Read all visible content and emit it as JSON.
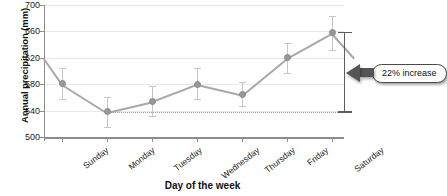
{
  "chart_data": {
    "type": "line",
    "title": "",
    "xlabel": "Day of the week",
    "ylabel": "Annual precipitation (mm)",
    "categories": [
      "Sunday",
      "Monday",
      "Tuesday",
      "Wednesday",
      "Thursday",
      "Friday",
      "Saturday"
    ],
    "values": [
      581,
      538,
      554,
      580,
      564,
      620,
      658
    ],
    "error_low": [
      558,
      515,
      532,
      557,
      547,
      597,
      632
    ],
    "error_high": [
      604,
      561,
      577,
      604,
      583,
      643,
      684
    ],
    "ylim": [
      500,
      700
    ],
    "yticks": [
      500,
      540,
      580,
      620,
      660,
      700
    ],
    "ytick_labels": [
      "500",
      "540",
      "580",
      "620",
      "660",
      "700"
    ],
    "grid": true,
    "legend": "none",
    "reference_line": {
      "value": 538,
      "style": "dotted",
      "from": "Monday",
      "to": "Saturday"
    },
    "annotations": [
      {
        "text": "22% increase",
        "from_value": 538,
        "to_value": 658,
        "at": "Saturday"
      }
    ],
    "series_color": "#989898",
    "error_color": "#c6c6c6",
    "annotation_color": "#555555",
    "grid_color": "#e9e9e9",
    "axis_color": "#8d8d8d"
  }
}
